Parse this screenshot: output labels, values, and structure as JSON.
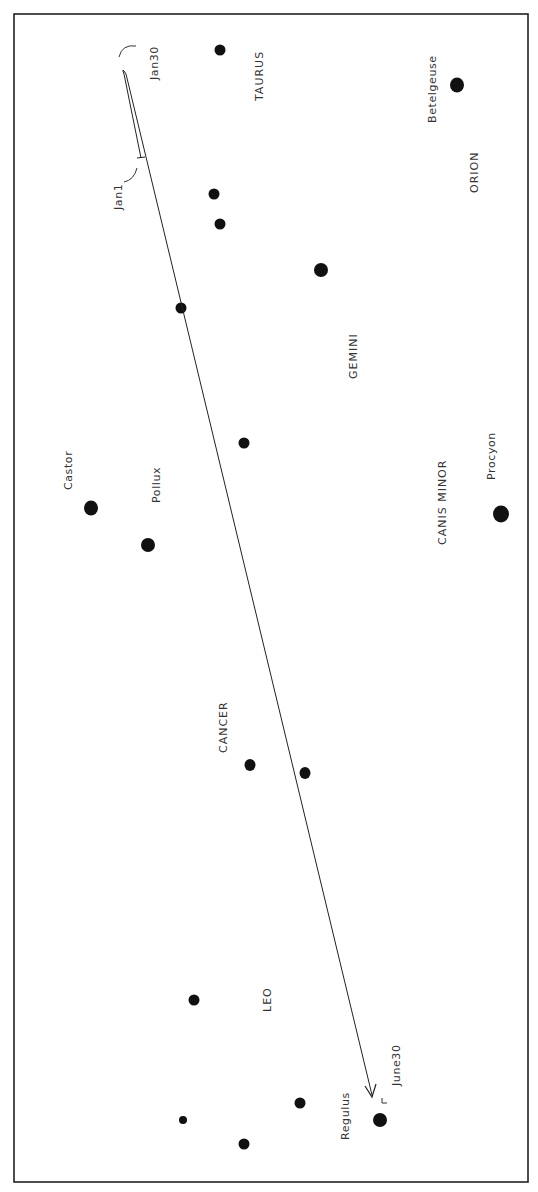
{
  "chart_data": {
    "type": "scatter",
    "title": "",
    "orientation": "rotated 90° (text reads bottom-to-top)",
    "colors": {
      "ink": "#111111",
      "text": "#333333",
      "border": "#222222",
      "background": "#ffffff"
    },
    "constellations": [
      {
        "id": "taurus",
        "label": "TAURUS"
      },
      {
        "id": "orion",
        "label": "ORION"
      },
      {
        "id": "gemini",
        "label": "GEMINI"
      },
      {
        "id": "canis-minor",
        "label": "CANIS MINOR"
      },
      {
        "id": "cancer",
        "label": "CANCER"
      },
      {
        "id": "leo",
        "label": "LEO"
      }
    ],
    "named_stars": [
      {
        "id": "betelgeuse",
        "label": "Betelgeuse",
        "magnitude_class": "bright"
      },
      {
        "id": "castor",
        "label": "Castor",
        "magnitude_class": "bright"
      },
      {
        "id": "pollux",
        "label": "Pollux",
        "magnitude_class": "bright"
      },
      {
        "id": "procyon",
        "label": "Procyon",
        "magnitude_class": "bright"
      },
      {
        "id": "regulus",
        "label": "Regulus",
        "magnitude_class": "bright"
      }
    ],
    "path": {
      "dates": [
        {
          "id": "jan1",
          "label": "Jan1"
        },
        {
          "id": "jan30",
          "label": "Jan30"
        },
        {
          "id": "june30",
          "label": "June30"
        }
      ]
    }
  }
}
